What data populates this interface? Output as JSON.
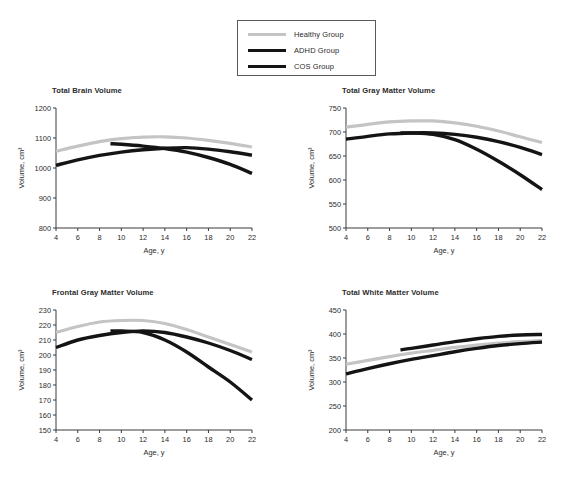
{
  "legend": {
    "entries": [
      {
        "label": "Healthy Group",
        "color": "#c4c4c4",
        "width": 3.2
      },
      {
        "label": "ADHD Group",
        "color": "#141414",
        "width": 3.4
      },
      {
        "label": "COS Group",
        "color": "#141414",
        "width": 3.4
      }
    ]
  },
  "axis_titles": {
    "x": "Age, y",
    "y": "Volume, cm³"
  },
  "chart_data": [
    {
      "type": "line",
      "title": "Total Brain Volume",
      "xlabel": "Age, y",
      "ylabel": "Volume, cm³",
      "xlim": [
        4,
        22
      ],
      "ylim": [
        800,
        1200
      ],
      "xticks": [
        4,
        6,
        8,
        10,
        12,
        14,
        16,
        18,
        20,
        22
      ],
      "yticks": [
        800,
        900,
        1000,
        1100,
        1200
      ],
      "grid": false,
      "legend_position": "top-center-shared",
      "series": [
        {
          "name": "Healthy Group",
          "color": "#c4c4c4",
          "x": [
            4,
            6,
            8,
            10,
            12,
            14,
            16,
            18,
            20,
            22
          ],
          "values": [
            1056,
            1073,
            1088,
            1098,
            1103,
            1104,
            1100,
            1092,
            1082,
            1070
          ]
        },
        {
          "name": "ADHD Group",
          "color": "#141414",
          "x": [
            4,
            6,
            8,
            10,
            12,
            14,
            16,
            18,
            20,
            22
          ],
          "values": [
            1009,
            1027,
            1042,
            1053,
            1061,
            1066,
            1068,
            1063,
            1054,
            1043
          ]
        },
        {
          "name": "COS Group",
          "color": "#141414",
          "x": [
            9,
            10,
            12,
            14,
            16,
            18,
            20,
            22
          ],
          "values": [
            1081,
            1079,
            1073,
            1065,
            1053,
            1035,
            1012,
            982
          ]
        }
      ]
    },
    {
      "type": "line",
      "title": "Total Gray Matter Volume",
      "xlabel": "Age, y",
      "ylabel": "Volume, cm³",
      "xlim": [
        4,
        22
      ],
      "ylim": [
        500,
        750
      ],
      "xticks": [
        4,
        6,
        8,
        10,
        12,
        14,
        16,
        18,
        20,
        22
      ],
      "yticks": [
        500,
        550,
        600,
        650,
        700,
        750
      ],
      "grid": false,
      "legend_position": "top-center-shared",
      "series": [
        {
          "name": "Healthy Group",
          "color": "#c4c4c4",
          "x": [
            4,
            6,
            8,
            10,
            12,
            14,
            16,
            18,
            20,
            22
          ],
          "values": [
            710,
            716,
            721,
            723,
            723,
            719,
            712,
            702,
            690,
            678
          ]
        },
        {
          "name": "ADHD Group",
          "color": "#141414",
          "x": [
            4,
            6,
            8,
            10,
            12,
            14,
            16,
            18,
            20,
            22
          ],
          "values": [
            685,
            691,
            696,
            698,
            698,
            695,
            689,
            680,
            668,
            653
          ]
        },
        {
          "name": "COS Group",
          "color": "#141414",
          "x": [
            9,
            10,
            12,
            14,
            16,
            18,
            20,
            22
          ],
          "values": [
            698,
            698,
            695,
            684,
            664,
            639,
            611,
            580
          ]
        }
      ]
    },
    {
      "type": "line",
      "title": "Frontal Gray Matter Volume",
      "xlabel": "Age, y",
      "ylabel": "Volume, cm³",
      "xlim": [
        4,
        22
      ],
      "ylim": [
        150,
        230
      ],
      "xticks": [
        4,
        6,
        8,
        10,
        12,
        14,
        16,
        18,
        20,
        22
      ],
      "yticks": [
        150,
        160,
        170,
        180,
        190,
        200,
        210,
        220,
        230
      ],
      "grid": false,
      "legend_position": "top-center-shared",
      "series": [
        {
          "name": "Healthy Group",
          "color": "#c4c4c4",
          "x": [
            4,
            6,
            8,
            10,
            12,
            14,
            16,
            18,
            20,
            22
          ],
          "values": [
            215,
            219,
            222,
            223,
            223,
            221,
            217,
            212,
            207,
            202
          ]
        },
        {
          "name": "ADHD Group",
          "color": "#141414",
          "x": [
            4,
            6,
            8,
            10,
            12,
            14,
            16,
            18,
            20,
            22
          ],
          "values": [
            205,
            210,
            213,
            215,
            216,
            215,
            212,
            208,
            203,
            197
          ]
        },
        {
          "name": "COS Group",
          "color": "#141414",
          "x": [
            9,
            10,
            12,
            14,
            16,
            18,
            20,
            22
          ],
          "values": [
            216,
            216,
            215,
            210,
            202,
            192,
            182,
            170
          ]
        }
      ]
    },
    {
      "type": "line",
      "title": "Total White Matter Volume",
      "xlabel": "Age, y",
      "ylabel": "Volume, cm³",
      "xlim": [
        4,
        22
      ],
      "ylim": [
        200,
        450
      ],
      "xticks": [
        4,
        6,
        8,
        10,
        12,
        14,
        16,
        18,
        20,
        22
      ],
      "yticks": [
        200,
        250,
        300,
        350,
        400,
        450
      ],
      "grid": false,
      "legend_position": "top-center-shared",
      "series": [
        {
          "name": "Healthy Group",
          "color": "#c4c4c4",
          "x": [
            4,
            6,
            8,
            10,
            12,
            14,
            16,
            18,
            20,
            22
          ],
          "values": [
            337,
            345,
            353,
            360,
            366,
            372,
            377,
            381,
            384,
            386
          ]
        },
        {
          "name": "ADHD Group",
          "color": "#141414",
          "x": [
            4,
            6,
            8,
            10,
            12,
            14,
            16,
            18,
            20,
            22
          ],
          "values": [
            317,
            328,
            338,
            347,
            355,
            363,
            370,
            376,
            380,
            383
          ]
        },
        {
          "name": "COS Group",
          "color": "#141414",
          "x": [
            9,
            10,
            12,
            14,
            16,
            18,
            20,
            22
          ],
          "values": [
            367,
            370,
            377,
            384,
            390,
            395,
            398,
            399
          ]
        }
      ]
    }
  ]
}
